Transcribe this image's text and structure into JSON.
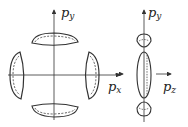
{
  "diagram": {
    "left_panel": {
      "axes": {
        "horizontal": "p",
        "horizontal_sub": "x",
        "vertical": "p",
        "vertical_sub": "y"
      },
      "lobes": [
        "top",
        "bottom",
        "left",
        "right"
      ]
    },
    "right_panel": {
      "axes": {
        "left": "p",
        "left_sub": "x",
        "right": "p",
        "right_sub": "z",
        "vertical": "p",
        "vertical_sub": "y"
      },
      "lobes": [
        "top-small",
        "center-ellipse",
        "bottom-small"
      ]
    },
    "colors": {
      "stroke": "#333333",
      "background": "#ffffff"
    }
  }
}
